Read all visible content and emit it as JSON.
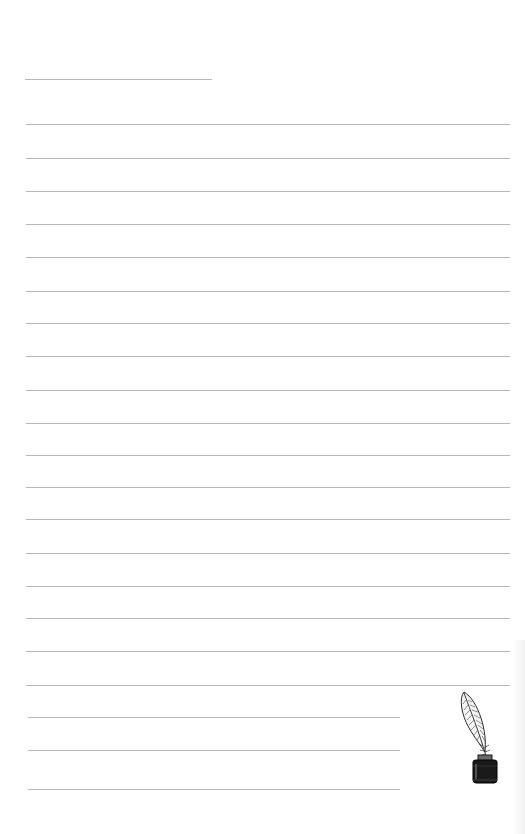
{
  "page": {
    "type": "lined-writing-paper",
    "background_color": "#ffffff",
    "rule_color": "#b8b8b8"
  },
  "header_line": {
    "x1": 25,
    "x2": 212,
    "y": 79
  },
  "full_lines": {
    "x1": 26,
    "x2": 510,
    "y_positions": [
      124,
      158,
      191,
      224,
      257,
      291,
      323,
      356,
      390,
      423,
      455,
      487,
      519,
      553,
      586,
      618,
      651,
      685
    ]
  },
  "short_lines": {
    "x1": 28,
    "x2": 400,
    "y_positions": [
      717,
      750,
      789
    ]
  },
  "illustration": {
    "icon": "quill-and-inkwell-icon",
    "ink_color": "#1a1a1a"
  }
}
